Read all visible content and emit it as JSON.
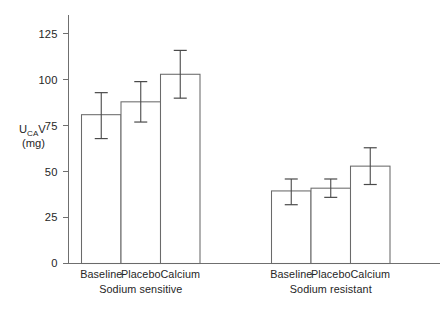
{
  "chart_data": {
    "type": "bar",
    "title": "",
    "xlabel": "",
    "ylabel": "U_CA V (mg)",
    "ylabel_main": "U",
    "ylabel_sub": "CA",
    "ylabel_main2": "V",
    "ylabel_unit": "(mg)",
    "ylim": [
      0,
      132
    ],
    "yticks": [
      0,
      25,
      50,
      75,
      100,
      125
    ],
    "ytick_labels": [
      "0",
      "25",
      "50",
      "75",
      "100",
      "125"
    ],
    "grid": false,
    "legend": "none",
    "categories": [
      "Baseline",
      "Placebo",
      "Calcium"
    ],
    "groups": [
      {
        "name": "Sodium sensitive",
        "bars": [
          {
            "label": "Baseline",
            "value": 81,
            "err_low": 68,
            "err_high": 93
          },
          {
            "label": "Placebo",
            "value": 88,
            "err_low": 77,
            "err_high": 99
          },
          {
            "label": "Calcium",
            "value": 103,
            "err_low": 90,
            "err_high": 116
          }
        ]
      },
      {
        "name": "Sodium resistant",
        "bars": [
          {
            "label": "Baseline",
            "value": 39.5,
            "err_low": 32,
            "err_high": 46
          },
          {
            "label": "Placebo",
            "value": 41,
            "err_low": 36,
            "err_high": 46
          },
          {
            "label": "Calcium",
            "value": 53,
            "err_low": 43,
            "err_high": 63
          }
        ]
      }
    ],
    "colors": {
      "bar_fill": "#ffffff",
      "bar_stroke": "#6a6a6a",
      "axis": "#6f6f6f",
      "error": "#4a4a4a",
      "text": "#262626",
      "background": "#ffffff"
    }
  }
}
